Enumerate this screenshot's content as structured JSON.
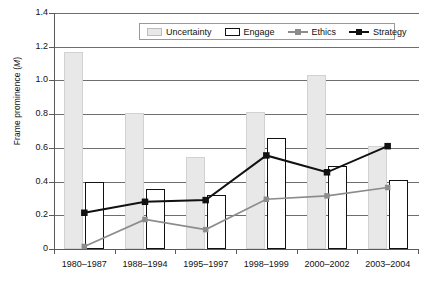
{
  "chart_data": {
    "type": "bar",
    "title": "",
    "xlabel": "",
    "ylabel": "Frame prominence (M)",
    "categories": [
      "1980–1987",
      "1988–1994",
      "1995–1997",
      "1998–1999",
      "2000–2002",
      "2003–2004"
    ],
    "ylim": [
      0,
      1.4
    ],
    "yticks": [
      "0",
      "0.2",
      "0.4",
      "0.6",
      "0.8",
      "1.0",
      "1.2",
      "1.4"
    ],
    "ytick_values": [
      0,
      0.2,
      0.4,
      0.6,
      0.8,
      1.0,
      1.2,
      1.4
    ],
    "grid": true,
    "legend_position": "top-center",
    "series": [
      {
        "name": "Uncertainty",
        "type": "bar",
        "style": "filled-gray",
        "color": "#e8e8e8",
        "values": [
          1.17,
          0.805,
          0.545,
          0.815,
          1.035,
          0.61
        ]
      },
      {
        "name": "Engage",
        "type": "bar",
        "style": "outline-black",
        "color": "#ffffff",
        "values": [
          0.4,
          0.355,
          0.32,
          0.66,
          0.49,
          0.41
        ]
      },
      {
        "name": "Ethics",
        "type": "line",
        "style": "gray-square-marker",
        "color": "#8c8c8c",
        "values": [
          0.015,
          0.175,
          0.115,
          0.295,
          0.315,
          0.365
        ]
      },
      {
        "name": "Strategy",
        "type": "line",
        "style": "black-square-marker",
        "color": "#111111",
        "values": [
          0.215,
          0.28,
          0.29,
          0.555,
          0.455,
          0.61
        ]
      }
    ]
  },
  "legend": {
    "items": [
      {
        "label": "Uncertainty"
      },
      {
        "label": "Engage"
      },
      {
        "label": "Ethics"
      },
      {
        "label": "Strategy"
      }
    ]
  },
  "colors": {
    "uncertainty_fill": "#e8e8e8",
    "engage_stroke": "#111111",
    "ethics_line": "#8c8c8c",
    "strategy_line": "#111111",
    "gridline": "#6e6e6e",
    "axis": "#5a5a5a"
  }
}
